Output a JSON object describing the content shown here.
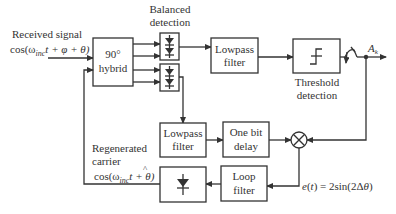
{
  "diagram": {
    "input": {
      "label_line1": "Received signal",
      "label_line2": "cos(ω",
      "label_sub": "inc",
      "label_rest": "t + φ + θ)"
    },
    "hybrid": {
      "line1": "90°",
      "line2": "hybrid"
    },
    "balanced_detection": {
      "line1": "Balanced",
      "line2": "detection"
    },
    "lowpass_top": {
      "line1": "Lowpass",
      "line2": "filter"
    },
    "threshold": {
      "label_line1": "Threshold",
      "label_line2": "detection"
    },
    "output": {
      "label": "A",
      "sub": "k"
    },
    "lowpass_bottom": {
      "line1": "Lowpass",
      "line2": "filter"
    },
    "delay": {
      "line1": "One bit",
      "line2": "delay"
    },
    "loop_filter": {
      "line1": "Loop",
      "line2": "filter"
    },
    "error_signal": {
      "label": "e(t) = 2sin(2Δθ)"
    },
    "regenerated": {
      "label_line1": "Regenerated",
      "label_line2": "carrier",
      "eq_pre": "cos(ω",
      "eq_sub": "inc",
      "eq_post": "t + θ)",
      "hat": "^"
    }
  },
  "colors": {
    "stroke": "#333333",
    "background": "#ffffff"
  }
}
